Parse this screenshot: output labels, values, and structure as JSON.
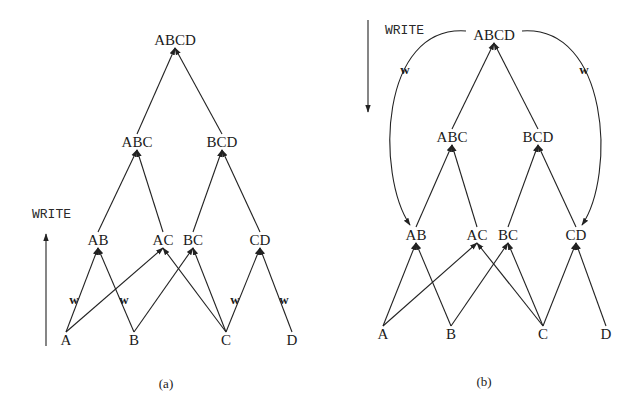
{
  "figure_a": {
    "caption": "(a)",
    "direction_label": "WRITE",
    "direction": "up",
    "nodes": [
      {
        "id": "ABCD",
        "label": "ABCD"
      },
      {
        "id": "ABC",
        "label": "ABC"
      },
      {
        "id": "BCD",
        "label": "BCD"
      },
      {
        "id": "AB",
        "label": "AB"
      },
      {
        "id": "AC",
        "label": "AC"
      },
      {
        "id": "BC",
        "label": "BC"
      },
      {
        "id": "CD",
        "label": "CD"
      },
      {
        "id": "A",
        "label": "A"
      },
      {
        "id": "B",
        "label": "B"
      },
      {
        "id": "C",
        "label": "C"
      },
      {
        "id": "D",
        "label": "D"
      }
    ],
    "edges": [
      {
        "from": "ABC",
        "to": "ABCD"
      },
      {
        "from": "BCD",
        "to": "ABCD"
      },
      {
        "from": "AB",
        "to": "ABC"
      },
      {
        "from": "AC",
        "to": "ABC"
      },
      {
        "from": "BC",
        "to": "BCD"
      },
      {
        "from": "CD",
        "to": "BCD"
      },
      {
        "from": "A",
        "to": "AB",
        "label": "w"
      },
      {
        "from": "B",
        "to": "AB",
        "label": "w"
      },
      {
        "from": "A",
        "to": "AC"
      },
      {
        "from": "C",
        "to": "AC"
      },
      {
        "from": "B",
        "to": "BC"
      },
      {
        "from": "C",
        "to": "BC"
      },
      {
        "from": "C",
        "to": "CD",
        "label": "w"
      },
      {
        "from": "D",
        "to": "CD",
        "label": "w"
      }
    ]
  },
  "figure_b": {
    "caption": "(b)",
    "direction_label": "WRITE",
    "direction": "down",
    "nodes": [
      {
        "id": "ABCD",
        "label": "ABCD"
      },
      {
        "id": "ABC",
        "label": "ABC"
      },
      {
        "id": "BCD",
        "label": "BCD"
      },
      {
        "id": "AB",
        "label": "AB"
      },
      {
        "id": "AC",
        "label": "AC"
      },
      {
        "id": "BC",
        "label": "BC"
      },
      {
        "id": "CD",
        "label": "CD"
      },
      {
        "id": "A",
        "label": "A"
      },
      {
        "id": "B",
        "label": "B"
      },
      {
        "id": "C",
        "label": "C"
      },
      {
        "id": "D",
        "label": "D"
      }
    ],
    "edges": [
      {
        "from": "ABC",
        "to": "ABCD"
      },
      {
        "from": "BCD",
        "to": "ABCD"
      },
      {
        "from": "AB",
        "to": "ABC"
      },
      {
        "from": "AC",
        "to": "ABC"
      },
      {
        "from": "BC",
        "to": "BCD"
      },
      {
        "from": "CD",
        "to": "BCD"
      },
      {
        "from": "A",
        "to": "AB"
      },
      {
        "from": "B",
        "to": "AB"
      },
      {
        "from": "A",
        "to": "AC"
      },
      {
        "from": "C",
        "to": "AC"
      },
      {
        "from": "B",
        "to": "BC"
      },
      {
        "from": "C",
        "to": "BC"
      },
      {
        "from": "C",
        "to": "CD"
      },
      {
        "from": "D",
        "to": "CD"
      },
      {
        "from": "ABCD",
        "to": "AB",
        "curved": true,
        "label": "w"
      },
      {
        "from": "ABCD",
        "to": "CD",
        "curved": true,
        "label": "w"
      }
    ]
  }
}
